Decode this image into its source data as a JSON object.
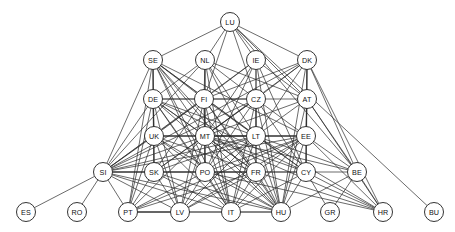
{
  "graph": {
    "title": "",
    "type": "node-link-network",
    "background_color": "#ffffff",
    "node_fill_color": "#ffffff",
    "node_stroke_color": "#1d1d1d",
    "edge_color": "#2b2b2b",
    "node_radius": 9.5,
    "width": 455,
    "height": 232,
    "nodes": [
      {
        "id": "LU",
        "label": "LU",
        "x": 230,
        "y": 22
      },
      {
        "id": "SE",
        "label": "SE",
        "x": 153,
        "y": 60
      },
      {
        "id": "NL",
        "label": "NL",
        "x": 205,
        "y": 60
      },
      {
        "id": "IE",
        "label": "IE",
        "x": 256,
        "y": 60
      },
      {
        "id": "DK",
        "label": "DK",
        "x": 307,
        "y": 60
      },
      {
        "id": "DE",
        "label": "DE",
        "x": 153,
        "y": 99
      },
      {
        "id": "FI",
        "label": "FI",
        "x": 204,
        "y": 99
      },
      {
        "id": "CZ",
        "label": "CZ",
        "x": 256,
        "y": 99
      },
      {
        "id": "AT",
        "label": "AT",
        "x": 307,
        "y": 99
      },
      {
        "id": "UK",
        "label": "UK",
        "x": 154,
        "y": 136
      },
      {
        "id": "MT",
        "label": "MT",
        "x": 205,
        "y": 136
      },
      {
        "id": "LT",
        "label": "LT",
        "x": 256,
        "y": 136
      },
      {
        "id": "EE",
        "label": "EE",
        "x": 306,
        "y": 136
      },
      {
        "id": "SI",
        "label": "SI",
        "x": 103,
        "y": 172
      },
      {
        "id": "SK",
        "label": "SK",
        "x": 154,
        "y": 172
      },
      {
        "id": "PO",
        "label": "PO",
        "x": 205,
        "y": 172
      },
      {
        "id": "FR",
        "label": "FR",
        "x": 256,
        "y": 172
      },
      {
        "id": "CY",
        "label": "CY",
        "x": 306,
        "y": 172
      },
      {
        "id": "BE",
        "label": "BE",
        "x": 357,
        "y": 172
      },
      {
        "id": "ES",
        "label": "ES",
        "x": 26,
        "y": 212
      },
      {
        "id": "RO",
        "label": "RO",
        "x": 77,
        "y": 212
      },
      {
        "id": "PT",
        "label": "PT",
        "x": 128,
        "y": 212
      },
      {
        "id": "LV",
        "label": "LV",
        "x": 180,
        "y": 212
      },
      {
        "id": "IT",
        "label": "IT",
        "x": 231,
        "y": 212
      },
      {
        "id": "HU",
        "label": "HU",
        "x": 281,
        "y": 212
      },
      {
        "id": "GR",
        "label": "GR",
        "x": 330,
        "y": 212
      },
      {
        "id": "HR",
        "label": "HR",
        "x": 383,
        "y": 212
      },
      {
        "id": "BU",
        "label": "BU",
        "x": 434,
        "y": 212
      }
    ],
    "edges": [
      [
        "LU",
        "SE"
      ],
      [
        "LU",
        "NL"
      ],
      [
        "LU",
        "IE"
      ],
      [
        "LU",
        "DK"
      ],
      [
        "LU",
        "AT"
      ],
      [
        "LU",
        "CZ"
      ],
      [
        "LU",
        "BE"
      ],
      [
        "LU",
        "BU"
      ],
      [
        "LU",
        "FI"
      ],
      [
        "SE",
        "DE"
      ],
      [
        "SE",
        "FI"
      ],
      [
        "SE",
        "UK"
      ],
      [
        "SE",
        "MT"
      ],
      [
        "SE",
        "SI"
      ],
      [
        "SE",
        "SK"
      ],
      [
        "SE",
        "PO"
      ],
      [
        "SE",
        "FR"
      ],
      [
        "SE",
        "LT"
      ],
      [
        "SE",
        "CY"
      ],
      [
        "SE",
        "IT"
      ],
      [
        "SE",
        "HU"
      ],
      [
        "SE",
        "PT"
      ],
      [
        "SE",
        "EE"
      ],
      [
        "NL",
        "DE"
      ],
      [
        "NL",
        "FI"
      ],
      [
        "NL",
        "CZ"
      ],
      [
        "NL",
        "MT"
      ],
      [
        "NL",
        "SI"
      ],
      [
        "NL",
        "PO"
      ],
      [
        "NL",
        "LT"
      ],
      [
        "NL",
        "IT"
      ],
      [
        "NL",
        "HU"
      ],
      [
        "NL",
        "AT"
      ],
      [
        "IE",
        "CZ"
      ],
      [
        "IE",
        "FI"
      ],
      [
        "IE",
        "AT"
      ],
      [
        "IE",
        "LT"
      ],
      [
        "IE",
        "MT"
      ],
      [
        "IE",
        "HU"
      ],
      [
        "IE",
        "CY"
      ],
      [
        "IE",
        "PO"
      ],
      [
        "IE",
        "SI"
      ],
      [
        "DK",
        "AT"
      ],
      [
        "DK",
        "CZ"
      ],
      [
        "DK",
        "FI"
      ],
      [
        "DK",
        "LT"
      ],
      [
        "DK",
        "EE"
      ],
      [
        "DK",
        "MT"
      ],
      [
        "DK",
        "SI"
      ],
      [
        "DK",
        "HU"
      ],
      [
        "DK",
        "CY"
      ],
      [
        "DK",
        "HR"
      ],
      [
        "DK",
        "BE"
      ],
      [
        "DE",
        "UK"
      ],
      [
        "DE",
        "FI"
      ],
      [
        "DE",
        "MT"
      ],
      [
        "DE",
        "SI"
      ],
      [
        "DE",
        "SK"
      ],
      [
        "DE",
        "PO"
      ],
      [
        "DE",
        "LT"
      ],
      [
        "DE",
        "FR"
      ],
      [
        "DE",
        "CZ"
      ],
      [
        "DE",
        "PT"
      ],
      [
        "DE",
        "IT"
      ],
      [
        "DE",
        "HU"
      ],
      [
        "DE",
        "LV"
      ],
      [
        "DE",
        "CY"
      ],
      [
        "FI",
        "MT"
      ],
      [
        "FI",
        "UK"
      ],
      [
        "FI",
        "LT"
      ],
      [
        "FI",
        "PO"
      ],
      [
        "FI",
        "SI"
      ],
      [
        "FI",
        "FR"
      ],
      [
        "FI",
        "IT"
      ],
      [
        "FI",
        "HU"
      ],
      [
        "FI",
        "CZ"
      ],
      [
        "FI",
        "SK"
      ],
      [
        "FI",
        "LV"
      ],
      [
        "CZ",
        "LT"
      ],
      [
        "CZ",
        "MT"
      ],
      [
        "CZ",
        "EE"
      ],
      [
        "CZ",
        "AT"
      ],
      [
        "CZ",
        "PO"
      ],
      [
        "CZ",
        "FR"
      ],
      [
        "CZ",
        "IT"
      ],
      [
        "CZ",
        "HU"
      ],
      [
        "CZ",
        "SI"
      ],
      [
        "CZ",
        "CY"
      ],
      [
        "CZ",
        "SK"
      ],
      [
        "AT",
        "EE"
      ],
      [
        "AT",
        "LT"
      ],
      [
        "AT",
        "CY"
      ],
      [
        "AT",
        "BE"
      ],
      [
        "AT",
        "HR"
      ],
      [
        "AT",
        "MT"
      ],
      [
        "AT",
        "HU"
      ],
      [
        "UK",
        "MT"
      ],
      [
        "UK",
        "SI"
      ],
      [
        "UK",
        "SK"
      ],
      [
        "UK",
        "PO"
      ],
      [
        "UK",
        "LT"
      ],
      [
        "UK",
        "FR"
      ],
      [
        "UK",
        "IT"
      ],
      [
        "UK",
        "PT"
      ],
      [
        "UK",
        "HU"
      ],
      [
        "UK",
        "LV"
      ],
      [
        "UK",
        "EE"
      ],
      [
        "MT",
        "LT"
      ],
      [
        "MT",
        "SI"
      ],
      [
        "MT",
        "SK"
      ],
      [
        "MT",
        "PO"
      ],
      [
        "MT",
        "FR"
      ],
      [
        "MT",
        "CY"
      ],
      [
        "MT",
        "EE"
      ],
      [
        "MT",
        "IT"
      ],
      [
        "MT",
        "HU"
      ],
      [
        "MT",
        "LV"
      ],
      [
        "MT",
        "PT"
      ],
      [
        "MT",
        "HR"
      ],
      [
        "MT",
        "BE"
      ],
      [
        "LT",
        "EE"
      ],
      [
        "LT",
        "PO"
      ],
      [
        "LT",
        "FR"
      ],
      [
        "LT",
        "CY"
      ],
      [
        "LT",
        "SI"
      ],
      [
        "LT",
        "IT"
      ],
      [
        "LT",
        "HU"
      ],
      [
        "LT",
        "HR"
      ],
      [
        "LT",
        "LV"
      ],
      [
        "LT",
        "SK"
      ],
      [
        "LT",
        "BE"
      ],
      [
        "EE",
        "CY"
      ],
      [
        "EE",
        "FR"
      ],
      [
        "EE",
        "PO"
      ],
      [
        "EE",
        "BE"
      ],
      [
        "EE",
        "HU"
      ],
      [
        "EE",
        "HR"
      ],
      [
        "EE",
        "IT"
      ],
      [
        "EE",
        "SI"
      ],
      [
        "EE",
        "PT"
      ],
      [
        "EE",
        "LV"
      ],
      [
        "SI",
        "SK"
      ],
      [
        "SI",
        "PO"
      ],
      [
        "SI",
        "ES"
      ],
      [
        "SI",
        "RO"
      ],
      [
        "SI",
        "PT"
      ],
      [
        "SI",
        "LV"
      ],
      [
        "SI",
        "IT"
      ],
      [
        "SI",
        "HU"
      ],
      [
        "SI",
        "FR"
      ],
      [
        "SK",
        "PO"
      ],
      [
        "SK",
        "PT"
      ],
      [
        "SK",
        "IT"
      ],
      [
        "SK",
        "HU"
      ],
      [
        "SK",
        "LV"
      ],
      [
        "PO",
        "FR"
      ],
      [
        "PO",
        "CY"
      ],
      [
        "PO",
        "IT"
      ],
      [
        "PO",
        "HU"
      ],
      [
        "PO",
        "LV"
      ],
      [
        "PO",
        "PT"
      ],
      [
        "PO",
        "HR"
      ],
      [
        "FR",
        "CY"
      ],
      [
        "FR",
        "IT"
      ],
      [
        "FR",
        "HU"
      ],
      [
        "FR",
        "HR"
      ],
      [
        "FR",
        "PT"
      ],
      [
        "FR",
        "LV"
      ],
      [
        "CY",
        "BE"
      ],
      [
        "CY",
        "HU"
      ],
      [
        "CY",
        "GR"
      ],
      [
        "CY",
        "HR"
      ],
      [
        "CY",
        "IT"
      ],
      [
        "BE",
        "HR"
      ],
      [
        "BE",
        "HU"
      ],
      [
        "BE",
        "GR"
      ],
      [
        "PT",
        "LV"
      ],
      [
        "PT",
        "IT"
      ],
      [
        "PT",
        "HU"
      ],
      [
        "IT",
        "HU"
      ]
    ]
  }
}
